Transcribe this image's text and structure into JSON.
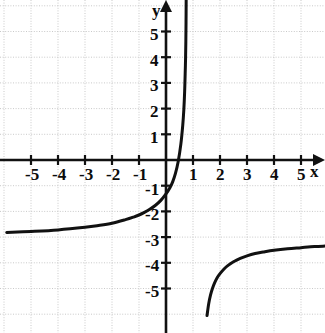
{
  "figure": {
    "width": 325,
    "height": 333,
    "background_color": "#ffffff",
    "axis_color": "#111111",
    "curve_color": "#111111",
    "grid_color": "#c9c9c9",
    "grid_style": "dotted"
  },
  "axes": {
    "x_label": "x",
    "y_label": "y",
    "x_tick_labels": [
      "-5",
      "-4",
      "-3",
      "-2",
      "-1",
      "1",
      "2",
      "3",
      "4",
      "5"
    ],
    "y_tick_labels": [
      "5",
      "4",
      "3",
      "2",
      "1",
      "-1",
      "-2",
      "-3",
      "-4",
      "-5"
    ],
    "origin_label": ""
  },
  "chart_data": {
    "type": "line",
    "title": "",
    "xlabel": "x",
    "ylabel": "y",
    "xlim": [
      -5.9,
      5.9
    ],
    "ylim": [
      -6.05,
      6.22
    ],
    "xticks": [
      -5,
      -4,
      -3,
      -2,
      -1,
      1,
      2,
      3,
      4,
      5
    ],
    "yticks": [
      5,
      4,
      3,
      2,
      1,
      -1,
      -2,
      -3,
      -4,
      -5
    ],
    "grid": true,
    "legend": "none",
    "annotations": [],
    "asymptotes": {
      "vertical": 0.78,
      "horizontal": -3.25
    },
    "series": [
      {
        "name": "left branch",
        "comment": "approaches y = -3.25 as x decreases; rises steeply toward the vertical asymptote x = 0.78",
        "x": [
          -5.9,
          -5.0,
          -4.0,
          -3.0,
          -2.5,
          -2.0,
          -1.5,
          -1.2,
          -1.0,
          -0.8,
          -0.6,
          -0.4,
          -0.2,
          0.0,
          0.15,
          0.25,
          0.35,
          0.45,
          0.55,
          0.62,
          0.66,
          0.69,
          0.71,
          0.725,
          0.735,
          0.742,
          0.747
        ],
        "y": [
          -2.82,
          -2.78,
          -2.72,
          -2.62,
          -2.55,
          -2.46,
          -2.32,
          -2.22,
          -2.14,
          -2.04,
          -1.92,
          -1.77,
          -1.58,
          -1.32,
          -1.07,
          -0.84,
          -0.52,
          -0.07,
          0.62,
          1.35,
          1.95,
          2.65,
          3.35,
          3.95,
          4.6,
          5.35,
          6.22
        ]
      },
      {
        "name": "right branch",
        "comment": "rises from below the visible frame at x = 1.5 and approaches y = -3.3 as x increases",
        "x": [
          1.52,
          1.58,
          1.65,
          1.72,
          1.8,
          1.9,
          2.0,
          2.15,
          2.3,
          2.5,
          2.75,
          3.0,
          3.3,
          3.6,
          4.0,
          4.5,
          5.0,
          5.5,
          5.9
        ],
        "y": [
          -6.05,
          -5.6,
          -5.25,
          -5.0,
          -4.78,
          -4.57,
          -4.42,
          -4.24,
          -4.1,
          -3.96,
          -3.83,
          -3.73,
          -3.64,
          -3.58,
          -3.51,
          -3.45,
          -3.41,
          -3.37,
          -3.35
        ]
      }
    ]
  },
  "geometry": {
    "origin_x": 166,
    "origin_y": 160,
    "unit_x": 27.0,
    "unit_y": 25.7
  }
}
